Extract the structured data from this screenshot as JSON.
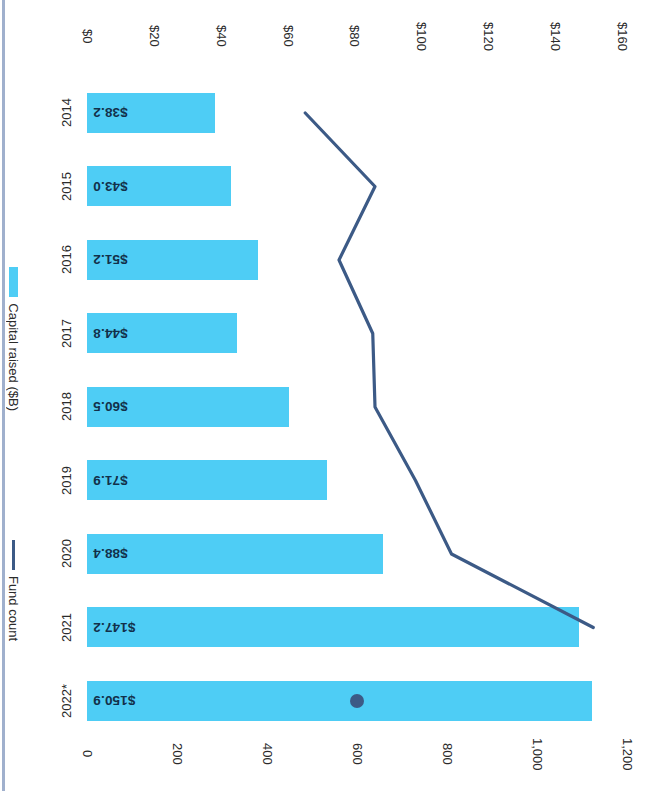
{
  "chart_data": {
    "type": "bar",
    "title": "",
    "subtitle": "",
    "orientation": "vertical",
    "categories": [
      "2014",
      "2015",
      "2016",
      "2017",
      "2018",
      "2019",
      "2020",
      "2021",
      "2022*"
    ],
    "series": [
      {
        "name": "Capital raised ($B)",
        "type": "bar",
        "color": "#4ecdf5",
        "axis": "left",
        "values": [
          38.2,
          43.0,
          51.2,
          44.8,
          60.5,
          71.9,
          88.4,
          147.2,
          150.9
        ],
        "data_labels": [
          "$38.2",
          "$43.0",
          "$51.2",
          "$44.8",
          "$60.5",
          "$71.9",
          "$88.4",
          "$147.2",
          "$150.9"
        ]
      },
      {
        "name": "Fund count",
        "type": "line",
        "color": "#3c5a86",
        "axis": "right",
        "values": [
          485,
          640,
          560,
          635,
          640,
          730,
          810,
          1125,
          600
        ],
        "marker_points": [
          "2022*"
        ]
      }
    ],
    "xlabel": "",
    "ylabel": "Capital raised ($B)",
    "y2label": "Fund count",
    "ylim": [
      0,
      160
    ],
    "y2lim": [
      0,
      1200
    ],
    "grid": false,
    "legend_position": "right",
    "axes": {
      "left": {
        "label": "Capital raised ($B)",
        "ticks": [
          "$0",
          "$20",
          "$40",
          "$60",
          "$80",
          "$100",
          "$120",
          "$140",
          "$160"
        ],
        "tick_values": [
          0,
          20,
          40,
          60,
          80,
          100,
          120,
          140,
          160
        ]
      },
      "right": {
        "label": "Fund count",
        "ticks": [
          "0",
          "200",
          "400",
          "600",
          "800",
          "1,000",
          "1,200"
        ],
        "tick_values": [
          0,
          200,
          400,
          600,
          800,
          1000,
          1200
        ]
      }
    },
    "legend": [
      {
        "label": "Capital raised ($B)",
        "marker": "bar-swatch",
        "color": "#4ecdf5"
      },
      {
        "label": "Fund count",
        "marker": "line-swatch",
        "color": "#3c5a86"
      }
    ],
    "footnote": "*",
    "colors": {
      "bar": "#4ecdf5",
      "line": "#3c5a86",
      "text": "#2b2b2b",
      "label_text": "#12304a",
      "background": "#ffffff",
      "page_edge": "#8fa2c4"
    }
  }
}
